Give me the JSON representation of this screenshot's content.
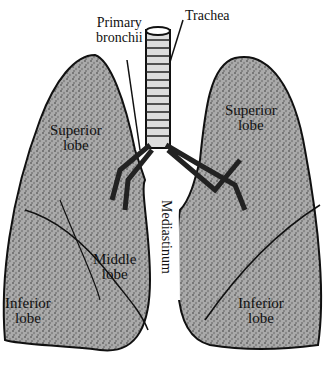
{
  "labels": {
    "primary_bronchii": [
      "Primary",
      "bronchii"
    ],
    "trachea": "Trachea",
    "left_superior_lobe": [
      "Superior",
      "lobe"
    ],
    "right_superior_lobe": [
      "Superior",
      "lobe"
    ],
    "middle_lobe": [
      "Middle",
      "lobe"
    ],
    "left_inferior_lobe": [
      "Inferior",
      "lobe"
    ],
    "right_inferior_lobe": [
      "Inferior",
      "lobe"
    ],
    "mediastinum": "Mediastinum"
  }
}
